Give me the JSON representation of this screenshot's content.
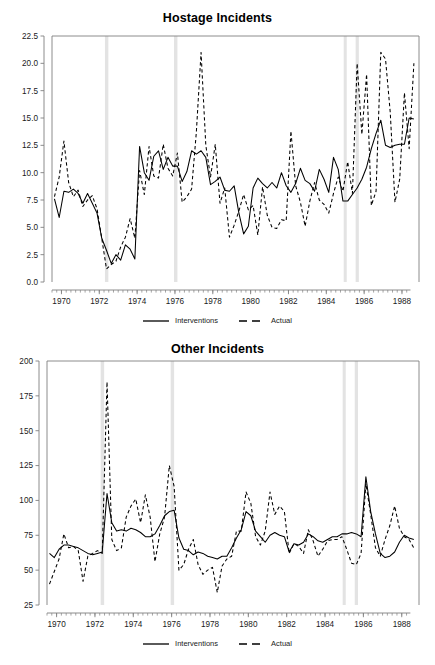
{
  "figure": {
    "background": "#ffffff",
    "foreground": "#000000",
    "axis_color": "#808080",
    "band_color": "#e3e3e3"
  },
  "legend": {
    "solid_label": "Interventions",
    "dashed_label": "Actual"
  },
  "chart_data": [
    {
      "type": "line",
      "title": "Hostage Incidents",
      "xlabel": "",
      "ylabel": "",
      "xlim": [
        1969.5,
        1988.9
      ],
      "ylim": [
        0.0,
        22.5
      ],
      "yticks": [
        0.0,
        2.5,
        5.0,
        7.5,
        10.0,
        12.5,
        15.0,
        17.5,
        20.0,
        22.5
      ],
      "ytick_labels": [
        "0.0",
        "2.5",
        "5.0",
        "7.5",
        "10.0",
        "12.5",
        "15.0",
        "17.5",
        "20.0",
        "22.5"
      ],
      "xticks": [
        1970,
        1972,
        1974,
        1976,
        1978,
        1980,
        1982,
        1984,
        1986,
        1988
      ],
      "xtick_labels": [
        "1970",
        "1972",
        "1974",
        "1976",
        "1978",
        "1980",
        "1982",
        "1984",
        "1986",
        "1988"
      ],
      "minor_xtick_interval": 0.25,
      "grid": false,
      "legend_position": "below",
      "intervention_bands": [
        {
          "start": 1972.3,
          "end": 1972.48
        },
        {
          "start": 1975.95,
          "end": 1976.13
        },
        {
          "start": 1984.92,
          "end": 1985.08
        },
        {
          "start": 1985.55,
          "end": 1985.72
        }
      ],
      "x": [
        1969.63,
        1969.88,
        1970.13,
        1970.38,
        1970.63,
        1970.88,
        1971.13,
        1971.38,
        1971.63,
        1971.88,
        1972.13,
        1972.38,
        1972.63,
        1972.88,
        1973.13,
        1973.38,
        1973.63,
        1973.88,
        1974.13,
        1974.38,
        1974.63,
        1974.88,
        1975.13,
        1975.38,
        1975.63,
        1975.88,
        1976.13,
        1976.38,
        1976.63,
        1976.88,
        1977.13,
        1977.38,
        1977.63,
        1977.88,
        1978.13,
        1978.38,
        1978.63,
        1978.88,
        1979.13,
        1979.38,
        1979.63,
        1979.88,
        1980.13,
        1980.38,
        1980.63,
        1980.88,
        1981.13,
        1981.38,
        1981.63,
        1981.88,
        1982.13,
        1982.38,
        1982.63,
        1982.88,
        1983.13,
        1983.38,
        1983.63,
        1983.88,
        1984.13,
        1984.38,
        1984.63,
        1984.88,
        1985.13,
        1985.38,
        1985.63,
        1985.88,
        1986.13,
        1986.38,
        1986.63,
        1986.88,
        1987.13,
        1987.38,
        1987.63,
        1987.88,
        1988.13,
        1988.38,
        1988.63
      ],
      "series": [
        {
          "name": "Interventions",
          "style": "solid",
          "values": [
            7.6,
            5.9,
            8.3,
            8.2,
            8.5,
            8.1,
            7.2,
            8.1,
            7.2,
            6.3,
            4.0,
            2.9,
            1.7,
            2.5,
            2.0,
            3.4,
            3.0,
            2.1,
            12.4,
            10.0,
            9.3,
            11.5,
            12.0,
            10.3,
            11.4,
            10.6,
            10.6,
            9.2,
            10.1,
            12.0,
            11.7,
            12.0,
            11.4,
            8.9,
            9.2,
            9.6,
            8.4,
            8.3,
            8.8,
            6.3,
            4.4,
            5.1,
            8.6,
            9.5,
            9.0,
            8.6,
            9.1,
            8.6,
            10.0,
            8.8,
            8.2,
            9.0,
            10.4,
            9.3,
            9.0,
            8.3,
            10.3,
            9.4,
            8.2,
            11.4,
            10.3,
            7.4,
            7.4,
            8.0,
            8.6,
            9.4,
            10.5,
            12.2,
            13.6,
            14.8,
            12.5,
            12.3,
            12.5,
            12.6,
            12.6,
            15.0,
            14.9
          ],
          "values_tail": [
            14.5,
            14.4,
            14.5,
            14.9,
            13.7,
            12.0,
            13.3,
            13.0,
            12.5,
            13.1,
            11.4,
            12.0,
            12.4,
            12.8,
            11.5,
            10.5
          ]
        },
        {
          "name": "Actual",
          "style": "dashed",
          "values": [
            7.8,
            9.6,
            12.9,
            9.1,
            7.8,
            8.4,
            6.9,
            7.5,
            7.9,
            6.7,
            4.0,
            1.2,
            1.6,
            1.9,
            3.2,
            4.1,
            5.8,
            4.0,
            10.2,
            8.0,
            12.4,
            9.7,
            9.5,
            12.6,
            10.4,
            9.7,
            11.8,
            7.3,
            7.8,
            8.5,
            13.7,
            21.0,
            12.5,
            9.6,
            12.6,
            7.2,
            8.6,
            4.1,
            5.2,
            6.5,
            8.0,
            6.6,
            7.0,
            4.3,
            8.7,
            6.1,
            5.0,
            4.9,
            5.7,
            5.6,
            13.8,
            8.8,
            7.3,
            5.1,
            7.4,
            9.1,
            7.5,
            7.1,
            6.3,
            8.1,
            9.6,
            8.3,
            11.0,
            8.1,
            20.0,
            13.5,
            19.0,
            7.0,
            8.3,
            21.0,
            20.4,
            15.5,
            7.3,
            9.4,
            17.3,
            12.2,
            20.0
          ],
          "values_tail": [
            10.2,
            9.4,
            11.0,
            9.5,
            11.3,
            8.3,
            10.0,
            12.2,
            18.7,
            14.5,
            5.1,
            6.0,
            12.7,
            11.0,
            10.4,
            10.5
          ]
        }
      ]
    },
    {
      "type": "line",
      "title": "Other Incidents",
      "xlabel": "",
      "ylabel": "",
      "xlim": [
        1969.5,
        1988.9
      ],
      "ylim": [
        25,
        200
      ],
      "yticks": [
        25,
        50,
        75,
        100,
        125,
        150,
        175,
        200
      ],
      "ytick_labels": [
        "25",
        "50",
        "75",
        "100",
        "125",
        "150",
        "175",
        "200"
      ],
      "xticks": [
        1970,
        1972,
        1974,
        1976,
        1978,
        1980,
        1982,
        1984,
        1986,
        1988
      ],
      "xtick_labels": [
        "1970",
        "1972",
        "1974",
        "1976",
        "1978",
        "1980",
        "1982",
        "1984",
        "1986",
        "1988"
      ],
      "minor_xtick_interval": 0.25,
      "grid": false,
      "legend_position": "below",
      "intervention_bands": [
        {
          "start": 1972.3,
          "end": 1972.48
        },
        {
          "start": 1975.95,
          "end": 1976.13
        },
        {
          "start": 1984.92,
          "end": 1985.08
        },
        {
          "start": 1985.55,
          "end": 1985.72
        }
      ],
      "x": [
        1969.63,
        1969.88,
        1970.13,
        1970.38,
        1970.63,
        1970.88,
        1971.13,
        1971.38,
        1971.63,
        1971.88,
        1972.13,
        1972.38,
        1972.63,
        1972.88,
        1973.13,
        1973.38,
        1973.63,
        1973.88,
        1974.13,
        1974.38,
        1974.63,
        1974.88,
        1975.13,
        1975.38,
        1975.63,
        1975.88,
        1976.13,
        1976.38,
        1976.63,
        1976.88,
        1977.13,
        1977.38,
        1977.63,
        1977.88,
        1978.13,
        1978.38,
        1978.63,
        1978.88,
        1979.13,
        1979.38,
        1979.63,
        1979.88,
        1980.13,
        1980.38,
        1980.63,
        1980.88,
        1981.13,
        1981.38,
        1981.63,
        1981.88,
        1982.13,
        1982.38,
        1982.63,
        1982.88,
        1983.13,
        1983.38,
        1983.63,
        1983.88,
        1984.13,
        1984.38,
        1984.63,
        1984.88,
        1985.13,
        1985.38,
        1985.63,
        1985.88,
        1986.13,
        1986.38,
        1986.63,
        1986.88,
        1987.13,
        1987.38,
        1987.63,
        1987.88,
        1988.13,
        1988.38,
        1988.63
      ],
      "series": [
        {
          "name": "Interventions",
          "style": "solid",
          "values": [
            62,
            59,
            65,
            68,
            68,
            67,
            66,
            64,
            62,
            61,
            62,
            63,
            105,
            84,
            78,
            79,
            78,
            80,
            79,
            77,
            74,
            74,
            76,
            82,
            89,
            92,
            93,
            73,
            65,
            64,
            61,
            63,
            62,
            60,
            59,
            58,
            60,
            60,
            66,
            73,
            79,
            92,
            89,
            78,
            74,
            70,
            75,
            77,
            75,
            74,
            63,
            69,
            68,
            70,
            76,
            74,
            71,
            70,
            72,
            74,
            74,
            76,
            76,
            77,
            76,
            74,
            117,
            92,
            76,
            62,
            59,
            60,
            63,
            70,
            75,
            73,
            72
          ],
          "values_tail": [
            68,
            60,
            58
          ]
        },
        {
          "name": "Actual",
          "style": "dashed",
          "values": [
            40,
            49,
            58,
            76,
            66,
            67,
            64,
            42,
            60,
            62,
            64,
            62,
            185,
            72,
            64,
            66,
            88,
            96,
            101,
            84,
            104,
            88,
            56,
            76,
            88,
            125,
            110,
            50,
            54,
            65,
            72,
            54,
            47,
            50,
            52,
            34,
            53,
            58,
            60,
            78,
            78,
            106,
            98,
            74,
            68,
            78,
            106,
            90,
            96,
            92,
            62,
            69,
            67,
            62,
            79,
            71,
            60,
            65,
            71,
            72,
            72,
            74,
            65,
            55,
            54,
            62,
            112,
            90,
            66,
            60,
            72,
            82,
            96,
            80,
            74,
            72,
            66
          ],
          "values_tail": [
            56,
            48,
            41
          ]
        }
      ]
    }
  ]
}
